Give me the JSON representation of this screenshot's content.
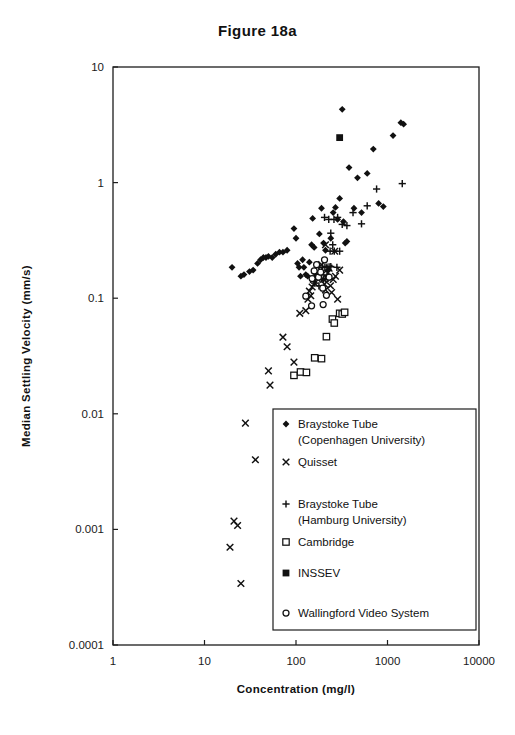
{
  "chart_data": {
    "type": "scatter",
    "title": "Figure 18a",
    "xlabel": "Concentration (mg/l)",
    "ylabel": "Median Settling Velocity (mm/s)",
    "xscale": "log",
    "yscale": "log",
    "xlim": [
      1,
      10000
    ],
    "ylim": [
      0.0001,
      10
    ],
    "xticks": [
      1,
      10,
      100,
      1000,
      10000
    ],
    "xtick_labels": [
      "1",
      "10",
      "100",
      "1000",
      "10000"
    ],
    "yticks": [
      10,
      1,
      0.1,
      0.01,
      0.001,
      0.0001
    ],
    "ytick_labels": [
      "10",
      "1",
      "0.1",
      "0.01",
      "0.001",
      "0.0001"
    ],
    "grid": false,
    "legend_position": "lower-center-right",
    "series": [
      {
        "name": "Braystoke Tube (Copenhagen University)",
        "marker": "filled-diamond",
        "color": "#111111",
        "points": [
          [
            20,
            0.185
          ],
          [
            25,
            0.155
          ],
          [
            27,
            0.16
          ],
          [
            31,
            0.17
          ],
          [
            34,
            0.175
          ],
          [
            38,
            0.2
          ],
          [
            41,
            0.215
          ],
          [
            44,
            0.225
          ],
          [
            47,
            0.225
          ],
          [
            50,
            0.23
          ],
          [
            55,
            0.225
          ],
          [
            60,
            0.24
          ],
          [
            66,
            0.25
          ],
          [
            72,
            0.25
          ],
          [
            80,
            0.26
          ],
          [
            95,
            0.4
          ],
          [
            100,
            0.33
          ],
          [
            104,
            0.2
          ],
          [
            108,
            0.185
          ],
          [
            112,
            0.155
          ],
          [
            118,
            0.215
          ],
          [
            122,
            0.185
          ],
          [
            128,
            0.16
          ],
          [
            134,
            0.155
          ],
          [
            140,
            0.205
          ],
          [
            148,
            0.29
          ],
          [
            152,
            0.49
          ],
          [
            158,
            0.275
          ],
          [
            165,
            0.155
          ],
          [
            172,
            0.155
          ],
          [
            180,
            0.36
          ],
          [
            190,
            0.6
          ],
          [
            200,
            0.3
          ],
          [
            210,
            0.26
          ],
          [
            225,
            0.175
          ],
          [
            240,
            0.33
          ],
          [
            255,
            0.55
          ],
          [
            270,
            0.61
          ],
          [
            285,
            0.48
          ],
          [
            300,
            0.73
          ],
          [
            320,
            4.3
          ],
          [
            330,
            0.46
          ],
          [
            345,
            0.3
          ],
          [
            360,
            0.31
          ],
          [
            380,
            1.35
          ],
          [
            430,
            0.6
          ],
          [
            470,
            1.1
          ],
          [
            520,
            0.55
          ],
          [
            600,
            1.2
          ],
          [
            700,
            1.95
          ],
          [
            800,
            0.66
          ],
          [
            900,
            0.62
          ],
          [
            1150,
            2.55
          ],
          [
            1400,
            3.3
          ],
          [
            1500,
            3.2
          ]
        ]
      },
      {
        "name": "Quisset",
        "marker": "x",
        "color": "#111111",
        "points": [
          [
            21,
            0.00118
          ],
          [
            23,
            0.00108
          ],
          [
            19,
            0.0007
          ],
          [
            25,
            0.00034
          ],
          [
            28,
            0.0083
          ],
          [
            36,
            0.004
          ],
          [
            50,
            0.0235
          ],
          [
            52,
            0.0177
          ],
          [
            72,
            0.046
          ],
          [
            80,
            0.038
          ],
          [
            95,
            0.028
          ],
          [
            110,
            0.074
          ],
          [
            128,
            0.078
          ],
          [
            135,
            0.098
          ],
          [
            140,
            0.115
          ],
          [
            145,
            0.105
          ],
          [
            150,
            0.125
          ],
          [
            155,
            0.145
          ],
          [
            160,
            0.135
          ],
          [
            165,
            0.155
          ],
          [
            170,
            0.148
          ],
          [
            175,
            0.165
          ],
          [
            180,
            0.155
          ],
          [
            185,
            0.175
          ],
          [
            190,
            0.195
          ],
          [
            196,
            0.162
          ],
          [
            200,
            0.145
          ],
          [
            205,
            0.132
          ],
          [
            210,
            0.118
          ],
          [
            215,
            0.152
          ],
          [
            222,
            0.165
          ],
          [
            230,
            0.182
          ],
          [
            238,
            0.128
          ],
          [
            245,
            0.112
          ],
          [
            255,
            0.145
          ],
          [
            265,
            0.255
          ],
          [
            210,
            0.29
          ],
          [
            270,
            0.155
          ],
          [
            285,
            0.098
          ],
          [
            300,
            0.175
          ]
        ]
      },
      {
        "name": "Braystoke Tube (Hamburg University)",
        "marker": "plus",
        "color": "#111111",
        "points": [
          [
            160,
            0.135
          ],
          [
            178,
            0.128
          ],
          [
            190,
            0.148
          ],
          [
            200,
            0.146
          ],
          [
            212,
            0.147
          ],
          [
            224,
            0.148
          ],
          [
            195,
            0.185
          ],
          [
            207,
            0.186
          ],
          [
            218,
            0.186
          ],
          [
            230,
            0.187
          ],
          [
            240,
            0.188
          ],
          [
            252,
            0.29
          ],
          [
            236,
            0.255
          ],
          [
            262,
            0.255
          ],
          [
            280,
            0.185
          ],
          [
            300,
            0.255
          ],
          [
            260,
            0.48
          ],
          [
            285,
            0.5
          ],
          [
            320,
            0.435
          ],
          [
            360,
            0.425
          ],
          [
            420,
            0.55
          ],
          [
            520,
            0.44
          ],
          [
            600,
            0.63
          ],
          [
            760,
            0.88
          ],
          [
            1450,
            0.98
          ],
          [
            240,
            0.365
          ],
          [
            205,
            0.5
          ],
          [
            228,
            0.48
          ]
        ]
      },
      {
        "name": "Cambridge",
        "marker": "open-square",
        "color": "#111111",
        "points": [
          [
            95,
            0.0215
          ],
          [
            112,
            0.023
          ],
          [
            130,
            0.0228
          ],
          [
            160,
            0.0305
          ],
          [
            190,
            0.03
          ],
          [
            215,
            0.0465
          ],
          [
            250,
            0.066
          ],
          [
            262,
            0.061
          ],
          [
            300,
            0.074
          ],
          [
            320,
            0.073
          ],
          [
            340,
            0.0755
          ]
        ]
      },
      {
        "name": "INSSEV",
        "marker": "filled-square",
        "color": "#111111",
        "points": [
          [
            300,
            2.45
          ]
        ]
      },
      {
        "name": "Wallingford Video System",
        "marker": "open-circle",
        "color": "#111111",
        "points": [
          [
            128,
            0.104
          ],
          [
            150,
            0.148
          ],
          [
            158,
            0.172
          ],
          [
            168,
            0.195
          ],
          [
            176,
            0.152
          ],
          [
            186,
            0.168
          ],
          [
            196,
            0.122
          ],
          [
            205,
            0.215
          ],
          [
            215,
            0.106
          ],
          [
            148,
            0.086
          ],
          [
            198,
            0.088
          ],
          [
            230,
            0.152
          ]
        ]
      }
    ]
  },
  "legend": {
    "entries": [
      {
        "label_line1": "Braystoke Tube",
        "label_line2": "(Copenhagen University)",
        "marker": "filled-diamond"
      },
      {
        "label_line1": "Quisset",
        "label_line2": "",
        "marker": "x"
      },
      {
        "label_line1": "Braystoke Tube",
        "label_line2": "(Hamburg University)",
        "marker": "plus"
      },
      {
        "label_line1": "Cambridge",
        "label_line2": "",
        "marker": "open-square"
      },
      {
        "label_line1": "INSSEV",
        "label_line2": "",
        "marker": "filled-square"
      },
      {
        "label_line1": "Wallingford Video System",
        "label_line2": "",
        "marker": "open-circle"
      }
    ]
  }
}
